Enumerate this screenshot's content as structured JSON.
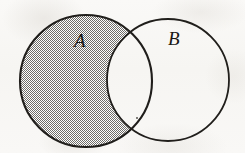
{
  "figure": {
    "kind": "venn-diagram",
    "width": 245,
    "height": 153,
    "background_color": "#f8f7f5",
    "stroke_color": "#201e1b",
    "shading_color": "#7c7a76",
    "shaded_region_label": "A",
    "shaded_region_description": "A minus B (left circle excluding the overlap)",
    "overlap_shaded": false
  },
  "sets": [
    {
      "id": "set-a",
      "label": "A",
      "cx": 86,
      "cy": 81,
      "r": 66,
      "filled": true,
      "fill_pattern": "dotted-stipple",
      "label_x": 81,
      "label_y": 40
    },
    {
      "id": "set-b",
      "label": "B",
      "cx": 168,
      "cy": 80,
      "r": 61,
      "filled": false,
      "fill_pattern": "none",
      "label_x": 175,
      "label_y": 38
    }
  ],
  "marks": [
    {
      "id": "speck",
      "kind": "ink-speck",
      "x": 137,
      "y": 118,
      "radius": 1
    }
  ]
}
